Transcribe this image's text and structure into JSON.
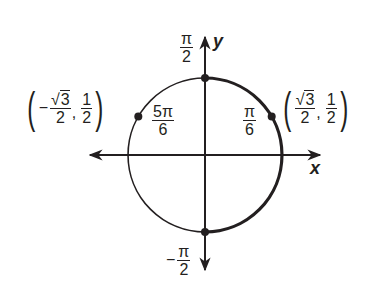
{
  "diagram": {
    "type": "unit-circle",
    "axes": {
      "x_label": "x",
      "y_label": "y"
    },
    "stroke_color": "#231f20",
    "angle_labels": [
      {
        "id": "pi-over-2",
        "sign": "",
        "numerator": "π",
        "denominator": "2"
      },
      {
        "id": "neg-pi-over-2",
        "sign": "−",
        "numerator": "π",
        "denominator": "2"
      },
      {
        "id": "pi-over-6",
        "sign": "",
        "numerator": "π",
        "denominator": "6"
      },
      {
        "id": "five-pi-over-6",
        "sign": "",
        "numerator": "5π",
        "denominator": "6"
      }
    ],
    "points": [
      {
        "id": "right",
        "angle": "π/6",
        "x_sign": "",
        "x_num": "√3",
        "x_radicand": "3",
        "x_den": "2",
        "y_num": "1",
        "y_den": "2"
      },
      {
        "id": "left",
        "angle": "5π/6",
        "x_sign": "−",
        "x_num": "√3",
        "x_radicand": "3",
        "x_den": "2",
        "y_num": "1",
        "y_den": "2"
      }
    ],
    "marked_points_degrees": [
      90,
      30,
      -90,
      150
    ],
    "bold_arc": {
      "from": "−π/2",
      "to": "π/2",
      "direction": "through 0"
    },
    "symbols": {
      "open_paren": "(",
      "close_paren": ")",
      "comma": ",",
      "sqrt": "√"
    }
  }
}
